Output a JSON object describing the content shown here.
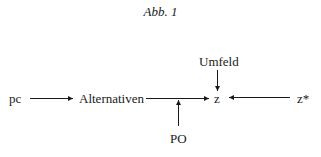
{
  "figure": {
    "title": "Abb. 1"
  },
  "nodes": {
    "pc": "pc",
    "alternativen": "Alternativen",
    "z": "z",
    "z_star": "z*",
    "umfeld": "Umfeld",
    "po": "PO"
  },
  "edges": [
    {
      "from": "pc",
      "to": "Alternativen"
    },
    {
      "from": "Alternativen",
      "to": "z"
    },
    {
      "from": "Umfeld",
      "to": "z"
    },
    {
      "from": "z*",
      "to": "z"
    },
    {
      "from": "PO",
      "to": "Alternativen→z edge"
    }
  ],
  "colors": {
    "ink": "#1a1a1a",
    "background": "#ffffff"
  }
}
